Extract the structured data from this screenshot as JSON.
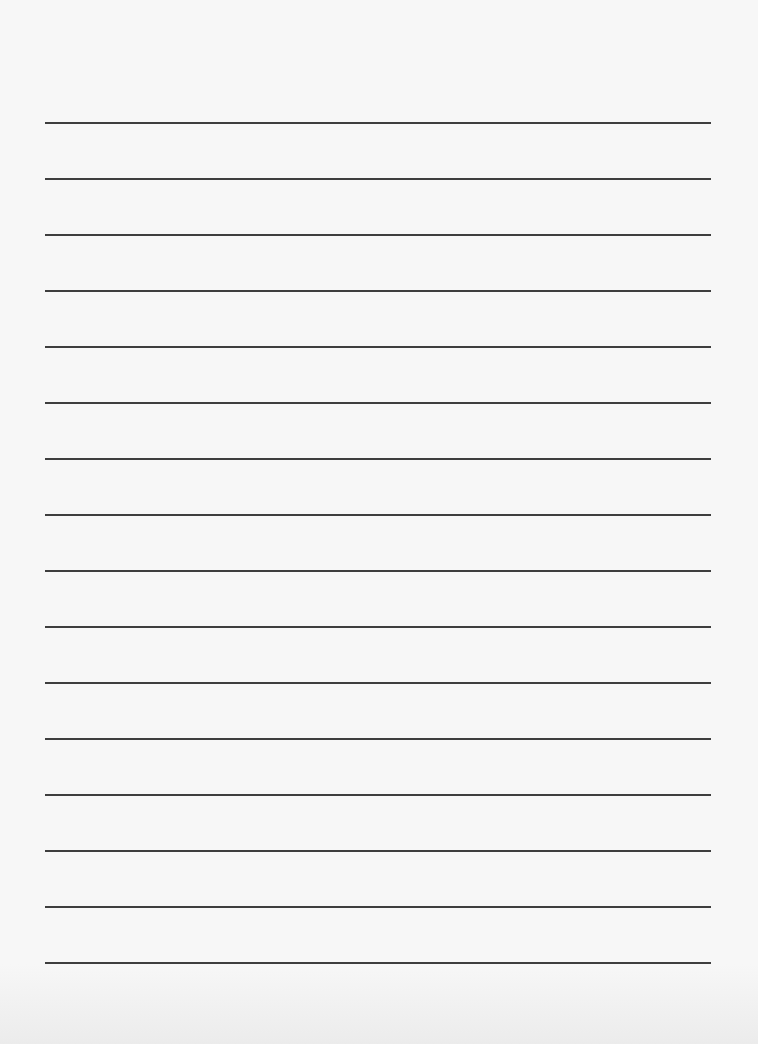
{
  "document": {
    "type": "lined-paper",
    "background_color": "#f7f7f7",
    "line_color": "#2e2e2e",
    "line_count": 16,
    "line_left_px": 45,
    "line_right_px": 711,
    "line_thickness_px": 2,
    "line_positions_y": [
      122,
      178,
      234,
      290,
      346,
      402,
      458,
      514,
      570,
      626,
      682,
      738,
      794,
      850,
      906,
      962
    ],
    "text_content": []
  }
}
